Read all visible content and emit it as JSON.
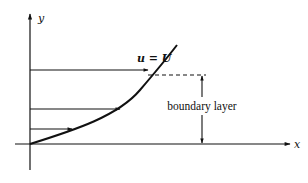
{
  "diagram": {
    "axes": {
      "x_label": "x",
      "y_label": "y"
    },
    "labels": {
      "free_stream": "u = U",
      "boundary_layer": "boundary layer"
    },
    "velocity_arrows": [
      {
        "y": 70,
        "x_end": 148
      },
      {
        "y": 109,
        "x_end": 120
      },
      {
        "y": 129,
        "x_end": 72
      }
    ],
    "colors": {
      "line": "#111111",
      "background": "#ffffff"
    }
  }
}
